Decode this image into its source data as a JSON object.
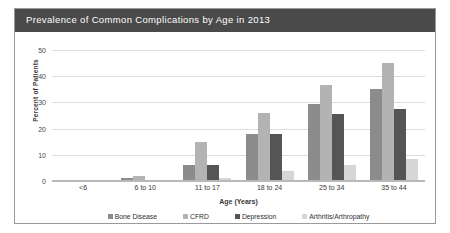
{
  "figure": {
    "title": "Prevalence of Common Complications by Age in 2013",
    "title_bar_color": "#4a4a4a",
    "border_color": "#9a9a9a",
    "background": "#ffffff"
  },
  "chart_data": {
    "type": "bar",
    "title": "Prevalence of Common Complications by Age in 2013",
    "xlabel": "Age (Years)",
    "ylabel": "Percent of Patients",
    "categories": [
      "<6",
      "6 to 10",
      "11 to 17",
      "18 to 24",
      "25 to 34",
      "35 to 44"
    ],
    "ylim": [
      0,
      50
    ],
    "yticks": [
      0,
      10,
      20,
      30,
      40,
      50
    ],
    "grid": true,
    "legend_position": "bottom",
    "series": [
      {
        "name": "Bone Disease",
        "color": "#8c8c8c",
        "values": [
          0.3,
          1.0,
          6.0,
          18.0,
          29.5,
          35.0
        ]
      },
      {
        "name": "CFRD",
        "color": "#b3b3b3",
        "values": [
          0.2,
          2.0,
          15.0,
          26.0,
          36.5,
          45.0
        ]
      },
      {
        "name": "Depression",
        "color": "#555555",
        "values": [
          0.3,
          0.5,
          6.0,
          18.0,
          25.5,
          27.5
        ]
      },
      {
        "name": "Arthritis/Arthropathy",
        "color": "#d6d6d6",
        "values": [
          0.1,
          0.2,
          1.0,
          4.0,
          6.0,
          8.5
        ]
      }
    ]
  }
}
